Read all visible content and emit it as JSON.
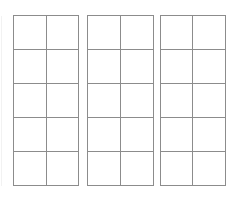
{
  "page": {
    "background_color": "#ffffff",
    "line_color": "#8c8c8c",
    "width": 240,
    "height": 201
  },
  "grids": [
    {
      "name": "grid-1",
      "columns": 2,
      "rows": 5,
      "cells": [
        [
          "",
          ""
        ],
        [
          "",
          ""
        ],
        [
          "",
          ""
        ],
        [
          "",
          ""
        ],
        [
          "",
          ""
        ]
      ]
    },
    {
      "name": "grid-2",
      "columns": 2,
      "rows": 5,
      "cells": [
        [
          "",
          ""
        ],
        [
          "",
          ""
        ],
        [
          "",
          ""
        ],
        [
          "",
          ""
        ],
        [
          "",
          ""
        ]
      ]
    },
    {
      "name": "grid-3",
      "columns": 2,
      "rows": 5,
      "cells": [
        [
          "",
          ""
        ],
        [
          "",
          ""
        ],
        [
          "",
          ""
        ],
        [
          "",
          ""
        ],
        [
          "",
          ""
        ]
      ]
    }
  ]
}
